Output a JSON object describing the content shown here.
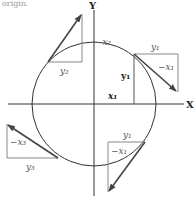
{
  "header": {
    "text": "origin."
  },
  "axes": {
    "x_label": "X",
    "y_label": "Y"
  },
  "labels": {
    "q1_top": "y₁",
    "q1_diag": "−x₁",
    "q1_vert": "y₁",
    "q1_horiz": "x₁",
    "q2_horiz": "y₂",
    "q2_vert": "−x₂",
    "q3_vert": "−x₃",
    "q3_horiz": "y₃",
    "q4_top": "y₁",
    "q4_vert": "−x₁"
  },
  "colors": {
    "axis": "#333333",
    "arrow": "#444444",
    "triangle": "#888888",
    "circle": "#333333"
  }
}
